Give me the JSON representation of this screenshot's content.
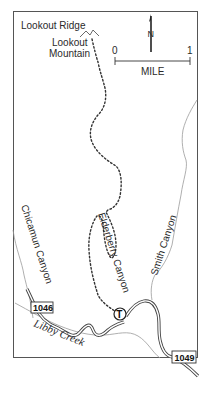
{
  "map": {
    "labels": {
      "lookout_ridge": "Lookout Ridge",
      "lookout_mountain_1": "Lookout",
      "lookout_mountain_2": "Mountain",
      "chicamun_canyon": "Chicamun Canyon",
      "elderberry_canyon": "Elderberry Canyon",
      "smith_canyon": "Smith Canyon",
      "libby_creek": "Libby Creek"
    },
    "scale_bar": {
      "start": "0",
      "end": "1",
      "unit": "MILE"
    },
    "north_arrow": {
      "label": "N"
    },
    "road_shields": [
      {
        "id": "1046",
        "label": "1046"
      },
      {
        "id": "1049",
        "label": "1049"
      }
    ],
    "trailhead": {
      "label": "T"
    },
    "colors": {
      "frame": "#555555",
      "road": "#444444",
      "trail": "#333333",
      "stream": "#9a9a9a",
      "text": "#2a2a2a"
    }
  }
}
